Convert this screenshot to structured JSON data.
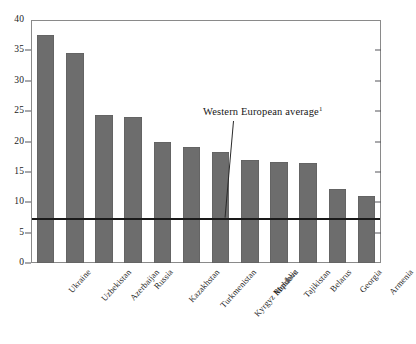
{
  "chart_data": {
    "type": "bar",
    "title": "",
    "subtitle": "",
    "xlabel": "",
    "ylabel": "",
    "ylim": [
      0,
      40
    ],
    "grid": false,
    "legend": "none",
    "categories": [
      "Ukraine",
      "Uzbekistan",
      "Azerbaijan",
      "Russia",
      "Kazakhstan",
      "Turkmenistan",
      "Kyrgyz Republic",
      "Moldova",
      "Tajikistan",
      "Belarus",
      "Georgia",
      "Armenia"
    ],
    "values": [
      37.5,
      34.5,
      24.4,
      24.0,
      20.0,
      19.1,
      18.2,
      17.0,
      16.7,
      16.4,
      12.2,
      11.0
    ],
    "ytick_labels": [
      "0",
      "5",
      "10",
      "15",
      "20",
      "25",
      "30",
      "35",
      "40"
    ],
    "ytick_values": [
      0,
      5,
      10,
      15,
      20,
      25,
      30,
      35,
      40
    ],
    "annotations": [
      {
        "text": "Western European average",
        "footnote_marker": "1",
        "value": 7.4,
        "kind": "reference-line"
      }
    ],
    "colors": {
      "bar_fill": "#6d6d6d",
      "reference_line": "#1a1a1a",
      "frame": "#8a8a8a",
      "text": "#1c1c1c",
      "background": "#ffffff"
    }
  }
}
